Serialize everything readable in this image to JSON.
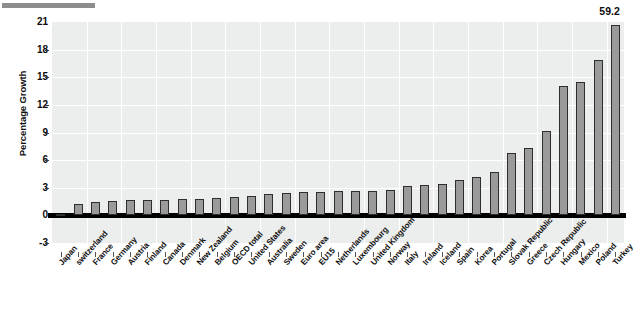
{
  "chart_data": {
    "type": "bar",
    "title": "",
    "subtitle": "",
    "xlabel": "",
    "ylabel": "Percentage Growth",
    "ylim": [
      -3,
      21
    ],
    "yticks": [
      -3,
      0,
      3,
      6,
      9,
      12,
      15,
      18,
      21
    ],
    "ytick_labels": [
      "-3",
      "0",
      "3",
      "6",
      "9",
      "12",
      "15",
      "18",
      "21"
    ],
    "grid": true,
    "legend": null,
    "bar_color": "#9a9a9a",
    "bar_edge_color": "#2e2e2e",
    "plot_background": "#eceded",
    "categories": [
      "Japan",
      "switzerland",
      "France",
      "Germany",
      "Austria",
      "Finland",
      "Canada",
      "Denmark",
      "New Zealand",
      "Belgium",
      "OECD total",
      "United States",
      "Australia",
      "Sweden",
      "Euro area",
      "EU15",
      "Netherlands",
      "Luxembourg",
      "United Kingdom",
      "Norway",
      "Italy",
      "Ireland",
      "Iceland",
      "Spain",
      "Korea",
      "Portugal",
      "Slovak Republic",
      "Greece",
      "Czech Republic",
      "Hungary",
      "Mexico",
      "Poland",
      "Turkey"
    ],
    "values": [
      0.2,
      1.2,
      1.5,
      1.6,
      1.7,
      1.7,
      1.7,
      1.8,
      1.8,
      1.9,
      2.0,
      2.1,
      2.3,
      2.4,
      2.5,
      2.5,
      2.6,
      2.6,
      2.7,
      2.8,
      3.2,
      3.3,
      3.4,
      3.8,
      4.2,
      4.7,
      6.8,
      7.3,
      9.2,
      14.1,
      14.5,
      16.9,
      20.7
    ],
    "annotations": [
      {
        "category": "Turkey",
        "label": "59.2",
        "actual_value": 59.2,
        "note": "bar clipped at axis maximum"
      }
    ]
  },
  "axis": {
    "y_title": "Percentage Growth"
  }
}
